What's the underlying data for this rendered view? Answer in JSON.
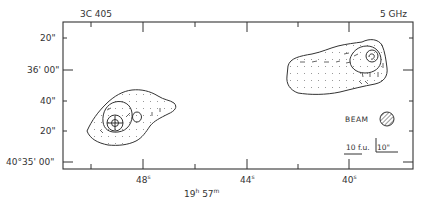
{
  "figure": {
    "source_name": "3C 405",
    "frequency": "5 GHz",
    "ra_center_label": "19h 57m",
    "ra_center_h": "19",
    "ra_center_m": "57",
    "y_ticks": [
      {
        "label": "20\"",
        "y": 38
      },
      {
        "label": "36' 00\"",
        "y": 70
      },
      {
        "label": "40\"",
        "y": 101
      },
      {
        "label": "20\"",
        "y": 131
      },
      {
        "label": "40°35' 00\"",
        "y": 162
      }
    ],
    "x_ticks": [
      {
        "label": "48s",
        "num": "48",
        "x": 143
      },
      {
        "label": "44s",
        "num": "44",
        "x": 247
      },
      {
        "label": "40s",
        "num": "40",
        "x": 349
      }
    ],
    "beam_label": "BEAM",
    "flux_scale_label": "10 f.u.",
    "angular_scale_label": "10\""
  }
}
